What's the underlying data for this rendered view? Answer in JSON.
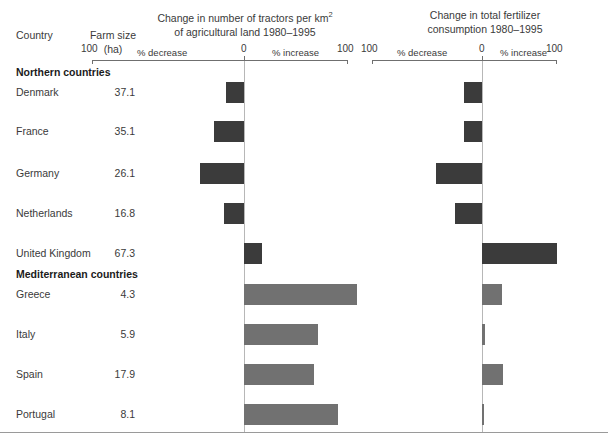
{
  "table": {
    "col_country": "Country",
    "col_farm_size": "Farm size",
    "col_farm_size_unit": "(ha)"
  },
  "charts": {
    "tractors": {
      "title_line1": "Change in number of tractors per km",
      "title_sup": "2",
      "title_line2": "of agricultural land 1980–1995",
      "tick_left": "100",
      "tick_zero": "0",
      "tick_right": "100",
      "label_decrease": "% decrease",
      "label_increase": "% increase"
    },
    "fertilizer": {
      "title_line1": "Change in total fertilizer",
      "title_line2": "consumption 1980–1995",
      "tick_left": "100",
      "tick_zero": "0",
      "tick_right": "100",
      "label_decrease": "% decrease",
      "label_increase": "% increase"
    }
  },
  "groups": [
    {
      "label": "Northern countries"
    },
    {
      "label": "Mediterranean countries"
    }
  ],
  "rows": [
    {
      "country": "Denmark",
      "farm_size": "37.1",
      "group": "north"
    },
    {
      "country": "France",
      "farm_size": "35.1",
      "group": "north"
    },
    {
      "country": "Germany",
      "farm_size": "26.1",
      "group": "north"
    },
    {
      "country": "Netherlands",
      "farm_size": "16.8",
      "group": "north"
    },
    {
      "country": "United Kingdom",
      "farm_size": "67.3",
      "group": "north"
    },
    {
      "country": "Greece",
      "farm_size": "4.3",
      "group": "med"
    },
    {
      "country": "Italy",
      "farm_size": "5.9",
      "group": "med"
    },
    {
      "country": "Spain",
      "farm_size": "17.9",
      "group": "med"
    },
    {
      "country": "Portugal",
      "farm_size": "8.1",
      "group": "med"
    }
  ],
  "colors": {
    "bar_north": "#3b3b3b",
    "bar_med": "#717171",
    "axis": "#6f6f6f",
    "zeroline": "#b7b7b7",
    "text": "#3a3a3a"
  },
  "chart_data": [
    {
      "type": "bar",
      "orientation": "horizontal",
      "title": "Change in number of tractors per km2 of agricultural land 1980–1995",
      "xlabel": "% change",
      "ylabel": "Country",
      "xlim": [
        -100,
        100
      ],
      "grid": false,
      "legend": "none",
      "categories": [
        "Denmark",
        "France",
        "Germany",
        "Netherlands",
        "United Kingdom",
        "Greece",
        "Italy",
        "Spain",
        "Portugal"
      ],
      "values": [
        -12,
        -20,
        -29,
        -13,
        17,
        109,
        71,
        67,
        90
      ],
      "annotations": [
        "% decrease",
        "% increase"
      ]
    },
    {
      "type": "bar",
      "orientation": "horizontal",
      "title": "Change in total fertilizer consumption 1980–1995",
      "xlabel": "% change",
      "ylabel": "Country",
      "xlim": [
        -100,
        100
      ],
      "grid": false,
      "legend": "none",
      "categories": [
        "Denmark",
        "France",
        "Germany",
        "Netherlands",
        "United Kingdom",
        "Greece",
        "Italy",
        "Spain",
        "Portugal"
      ],
      "values": [
        -16,
        -16,
        -42,
        -25,
        100,
        26,
        4,
        28,
        2
      ],
      "annotations": [
        "% decrease",
        "% increase"
      ]
    }
  ]
}
